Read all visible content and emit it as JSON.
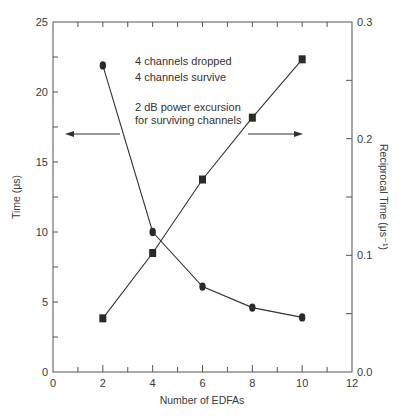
{
  "chart_data": {
    "type": "line",
    "title": "",
    "xlabel": "Number of EDFAs",
    "ylabel": "Time (μs)",
    "y2label": "Reciprocal Time (μs⁻¹)",
    "xlim": [
      0,
      12
    ],
    "ylim": [
      0,
      25
    ],
    "y2lim": [
      0.0,
      0.3
    ],
    "x_ticks": [
      "0",
      "2",
      "4",
      "6",
      "8",
      "10",
      "12"
    ],
    "y_ticks": [
      "0",
      "5",
      "10",
      "15",
      "20",
      "25"
    ],
    "y2_ticks": [
      "0.0",
      "0.1",
      "0.2",
      "0.3"
    ],
    "grid": false,
    "legend": null,
    "x": [
      2,
      4,
      6,
      8,
      10
    ],
    "series": [
      {
        "name": "Time",
        "axis": "left",
        "marker": "circle",
        "values": [
          21.9,
          10.0,
          6.1,
          4.6,
          3.9
        ]
      },
      {
        "name": "Reciprocal Time",
        "axis": "right",
        "marker": "square",
        "values": [
          0.046,
          0.102,
          0.165,
          0.218,
          0.268
        ]
      }
    ],
    "annotations": [
      "4 channels dropped",
      "4 channels survive",
      "2 dB power excursion",
      "for surviving channels"
    ],
    "arrows": [
      {
        "direction": "left",
        "meaning": "circle series reads on left axis"
      },
      {
        "direction": "right",
        "meaning": "square series reads on right axis"
      }
    ]
  }
}
